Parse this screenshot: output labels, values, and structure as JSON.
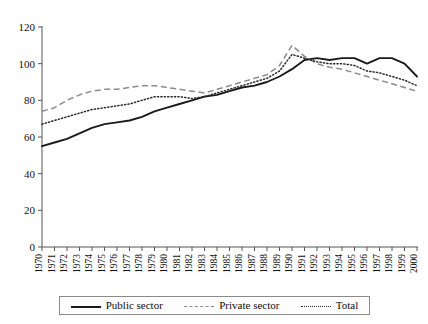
{
  "chart_data": {
    "type": "line",
    "title": "",
    "xlabel": "",
    "ylabel": "",
    "ylim": [
      0,
      120
    ],
    "yticks": [
      0,
      20,
      40,
      60,
      80,
      100,
      120
    ],
    "grid": false,
    "legend_position": "bottom",
    "categories": [
      "1970",
      "1971",
      "1972",
      "1973",
      "1974",
      "1975",
      "1976",
      "1977",
      "1978",
      "1979",
      "1980",
      "1981",
      "1982",
      "1983",
      "1984",
      "1985",
      "1986",
      "1987",
      "1988",
      "1989",
      "1990",
      "1991",
      "1992",
      "1993",
      "1994",
      "1995",
      "1996",
      "1997",
      "1998",
      "1999",
      "2000"
    ],
    "series": [
      {
        "name": "Public sector",
        "style": "solid",
        "color": "#1a1a1a",
        "values": [
          55,
          57,
          59,
          62,
          65,
          67,
          68,
          69,
          71,
          74,
          76,
          78,
          80,
          82,
          83,
          85,
          87,
          88,
          90,
          93,
          97,
          102,
          103,
          102,
          103,
          103,
          100,
          103,
          103,
          100,
          93
        ]
      },
      {
        "name": "Private sector",
        "style": "dashed",
        "color": "#8c8c8c",
        "values": [
          74,
          76,
          80,
          83,
          85,
          86,
          86,
          87,
          88,
          88,
          87,
          86,
          85,
          84,
          86,
          88,
          90,
          92,
          94,
          99,
          110,
          104,
          100,
          98,
          97,
          95,
          93,
          91,
          89,
          87,
          85
        ]
      },
      {
        "name": "Total",
        "style": "dotted",
        "color": "#2b2b2b",
        "values": [
          67,
          69,
          71,
          73,
          75,
          76,
          77,
          78,
          80,
          82,
          82,
          82,
          81,
          82,
          84,
          86,
          88,
          90,
          92,
          96,
          105,
          103,
          101,
          100,
          100,
          99,
          96,
          95,
          93,
          91,
          88
        ]
      }
    ]
  },
  "legend": {
    "items": [
      {
        "label": "Public sector",
        "swatch": "solid-line-swatch"
      },
      {
        "label": "Private sector",
        "swatch": "dashed-line-swatch"
      },
      {
        "label": "Total",
        "swatch": "dotted-line-swatch"
      }
    ]
  }
}
